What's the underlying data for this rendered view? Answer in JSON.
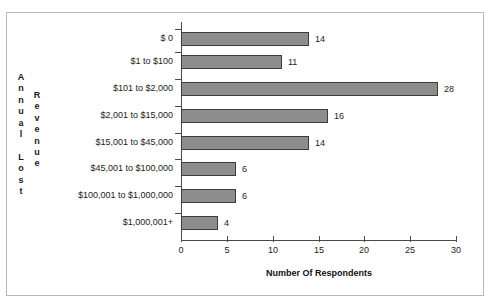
{
  "chart_data": {
    "type": "bar",
    "orientation": "horizontal",
    "title": "",
    "xlabel": "Number Of Respondents",
    "ylabel": "Annual Lost Revenue",
    "ylabel_columns": [
      "Annual Lost",
      "Revenue"
    ],
    "categories": [
      "$ 0",
      "$1 to $100",
      "$101 to $2,000",
      "$2,001 to $15,000",
      "$15,001 to $45,000",
      "$45,001 to $100,000",
      "$100,001 to $1,000,000",
      "$1,000,001+"
    ],
    "values": [
      14,
      11,
      28,
      16,
      14,
      6,
      6,
      4
    ],
    "value_labels": [
      "14",
      "11",
      "28",
      "16",
      "14",
      "6",
      "6",
      "4"
    ],
    "xlim": [
      0,
      30
    ],
    "xticks": [
      0,
      5,
      10,
      15,
      20,
      25,
      30
    ],
    "xtick_labels": [
      "0",
      "5",
      "10",
      "15",
      "20",
      "25",
      "30"
    ],
    "grid": false,
    "legend": false,
    "bar_color": "#8d8d8d",
    "bar_border_color": "#3c3c3c",
    "axis_color": "#4a4a4a",
    "frame_color": "#b9b9b9",
    "text_color": "#1c1c1c"
  },
  "axis_caption": {
    "column_one": "A\nn\nn\nu\na\nl\n \nL\no\ns\nt",
    "column_two": "R\ne\nv\ne\nn\nu\ne"
  }
}
